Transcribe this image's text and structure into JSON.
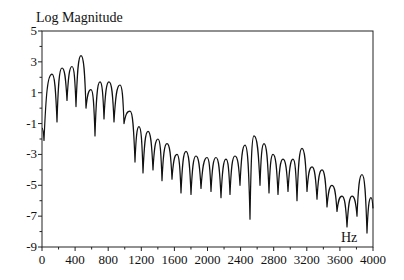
{
  "chart_data": {
    "type": "line",
    "title": "Log Magnitude",
    "xlabel": "Hz",
    "ylabel": "Log Magnitude",
    "xlim": [
      0,
      4000
    ],
    "ylim": [
      -9,
      5
    ],
    "grid": false,
    "legend": null,
    "x_ticks": [
      0,
      400,
      800,
      1200,
      1600,
      2000,
      2400,
      2800,
      3200,
      3600,
      4000
    ],
    "x_minor_step": 200,
    "y_ticks": [
      5,
      3,
      1,
      -1,
      -3,
      -5,
      -7,
      -9
    ],
    "y_minor_step": 1,
    "series": [
      {
        "name": "spectrum",
        "x": [
          0,
          24,
          121,
          181,
          242,
          302,
          363,
          411,
          471,
          532,
          592,
          640,
          701,
          749,
          810,
          870,
          943,
          991,
          1063,
          1124,
          1172,
          1221,
          1281,
          1341,
          1402,
          1450,
          1511,
          1571,
          1631,
          1680,
          1740,
          1801,
          1861,
          1921,
          1994,
          2042,
          2103,
          2163,
          2224,
          2272,
          2332,
          2393,
          2453,
          2514,
          2562,
          2634,
          2683,
          2743,
          2792,
          2852,
          2912,
          2973,
          3033,
          3082,
          3142,
          3202,
          3263,
          3323,
          3384,
          3444,
          3505,
          3565,
          3625,
          3686,
          3746,
          3807,
          3867,
          3927,
          3976,
          4000
        ],
        "y": [
          -1.3,
          -2.1,
          2.2,
          -0.9,
          2.6,
          0.5,
          2.7,
          0.1,
          3.4,
          0.0,
          1.2,
          -1.8,
          1.7,
          -0.7,
          1.7,
          -0.9,
          1.5,
          -1.0,
          -0.2,
          -3.5,
          -1.2,
          -4.2,
          -1.5,
          -4.0,
          -2.0,
          -4.7,
          -2.3,
          -4.6,
          -3.0,
          -5.5,
          -2.8,
          -5.6,
          -3.1,
          -5.2,
          -3.2,
          -5.4,
          -3.2,
          -5.8,
          -3.3,
          -5.6,
          -3.1,
          -5.0,
          -2.4,
          -7.2,
          -1.8,
          -5.0,
          -2.3,
          -5.5,
          -3.0,
          -5.6,
          -3.3,
          -5.4,
          -3.3,
          -6.0,
          -2.6,
          -5.4,
          -3.8,
          -5.9,
          -4.0,
          -6.4,
          -5.0,
          -6.7,
          -5.7,
          -7.7,
          -5.7,
          -7.0,
          -4.3,
          -8.1,
          -5.8,
          -6.5
        ]
      }
    ]
  }
}
